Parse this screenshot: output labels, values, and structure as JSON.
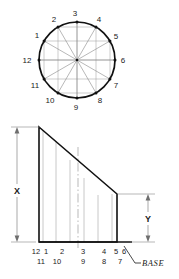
{
  "drawing": {
    "title": "",
    "plan_view": {
      "name": "circle-plan-view",
      "center": {
        "x": 77,
        "y": 60
      },
      "radius": 38,
      "division_count": 12,
      "points": [
        {
          "label": "1",
          "angle_deg": 150,
          "tx": 37,
          "ty": 38
        },
        {
          "label": "2",
          "angle_deg": 120,
          "tx": 54,
          "ty": 22
        },
        {
          "label": "3",
          "angle_deg": 90,
          "tx": 75,
          "ty": 16
        },
        {
          "label": "4",
          "angle_deg": 60,
          "tx": 98,
          "ty": 22
        },
        {
          "label": "5",
          "angle_deg": 30,
          "tx": 115,
          "ty": 38
        },
        {
          "label": "6",
          "angle_deg": 0,
          "tx": 121,
          "ty": 62
        },
        {
          "label": "7",
          "angle_deg": 330,
          "tx": 115,
          "ty": 86
        },
        {
          "label": "8",
          "angle_deg": 300,
          "tx": 98,
          "ty": 101
        },
        {
          "label": "9",
          "angle_deg": 270,
          "tx": 75,
          "ty": 108
        },
        {
          "label": "10",
          "angle_deg": 240,
          "tx": 51,
          "ty": 101
        },
        {
          "label": "11",
          "angle_deg": 210,
          "tx": 36,
          "ty": 86
        },
        {
          "label": "12",
          "angle_deg": 180,
          "tx": 28,
          "ty": 62
        }
      ]
    },
    "elevation_view": {
      "name": "elevation-trapezoid",
      "top_left": {
        "x": 39,
        "y": 127
      },
      "bottom_left": {
        "x": 39,
        "y": 242
      },
      "bottom_right": {
        "x": 117,
        "y": 242
      },
      "right_top": {
        "x": 117,
        "y": 194
      },
      "element_lines_x": [
        43,
        56,
        70,
        84,
        98,
        112
      ],
      "centerline_x": 78
    },
    "dimensions": [
      {
        "name": "dimension-x",
        "label": "X",
        "orientation": "vertical",
        "line_x": 17,
        "top_y": 127,
        "bottom_y": 242,
        "label_y": 190
      },
      {
        "name": "dimension-y",
        "label": "Y",
        "orientation": "vertical",
        "line_x": 148,
        "top_y": 194,
        "bottom_y": 242,
        "label_y": 222
      }
    ],
    "base_label": {
      "name": "base-label",
      "text": "BASE",
      "x": 138,
      "y": 266
    },
    "station_labels": {
      "top_row": [
        {
          "text": "12",
          "x": 36
        },
        {
          "text": "1",
          "x": 46
        },
        {
          "text": "2",
          "x": 62
        },
        {
          "text": "3",
          "x": 83
        },
        {
          "text": "4",
          "x": 104
        },
        {
          "text": "5",
          "x": 116
        },
        {
          "text": "6",
          "x": 124
        }
      ],
      "bottom_row": [
        {
          "text": "11",
          "x": 41
        },
        {
          "text": "10",
          "x": 57
        },
        {
          "text": "9",
          "x": 83
        },
        {
          "text": "8",
          "x": 104
        },
        {
          "text": "7",
          "x": 120
        }
      ],
      "top_row_y": 254,
      "bottom_row_y": 264
    },
    "colors": {
      "outline": "#1a1a1a",
      "construction": "#9a9a9a",
      "dimension": "#6e6e6e",
      "background": "#ffffff"
    }
  }
}
